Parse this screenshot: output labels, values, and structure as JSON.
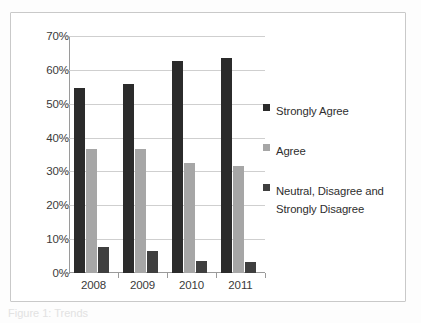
{
  "figure": {
    "caption": "Figure 1: Trends"
  },
  "chart_data": {
    "type": "bar",
    "title": "",
    "subtitle": "",
    "xlabel": "",
    "ylabel": "",
    "categories": [
      "2008",
      "2009",
      "2010",
      "2011"
    ],
    "yticks": [
      "0%",
      "10%",
      "20%",
      "30%",
      "40%",
      "50%",
      "60%",
      "70%"
    ],
    "ytick_values": [
      0,
      10,
      20,
      30,
      40,
      50,
      60,
      70
    ],
    "ylim": [
      0,
      70
    ],
    "grid": true,
    "legend_position": "right",
    "series": [
      {
        "name": "Strongly Agree",
        "color": "#2b2b2b",
        "values": [
          54.7,
          55.8,
          62.5,
          63.5
        ]
      },
      {
        "name": "Agree",
        "color": "#a6a6a6",
        "values": [
          36.7,
          36.5,
          32.6,
          31.5
        ]
      },
      {
        "name": "Neutral, Disagree and Strongly Disagree",
        "color": "#3f3f3f",
        "values": [
          7.8,
          6.6,
          3.5,
          3.4
        ]
      }
    ]
  },
  "legend": {
    "items": [
      {
        "label": "Strongly Agree"
      },
      {
        "label": "Agree"
      },
      {
        "label": "Neutral, Disagree and Strongly Disagree"
      }
    ]
  }
}
